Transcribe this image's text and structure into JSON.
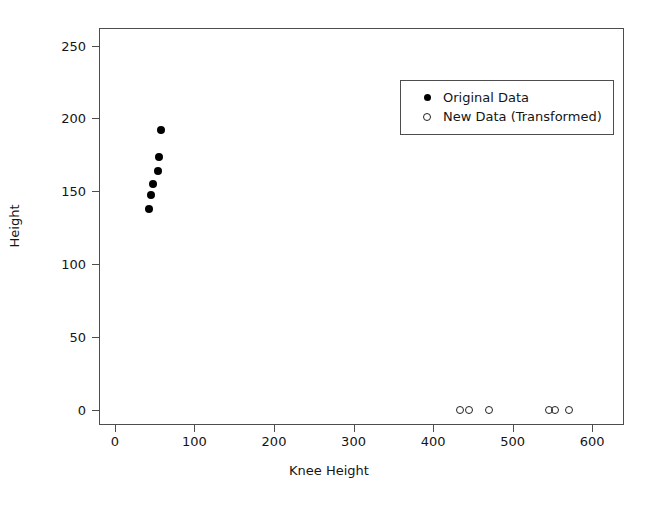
{
  "chart_data": {
    "type": "scatter",
    "title": "",
    "xlabel": "Knee Height",
    "ylabel": "Height",
    "xlim": [
      -20,
      640
    ],
    "ylim": [
      -10,
      262
    ],
    "xticks": [
      0,
      100,
      200,
      300,
      400,
      500,
      600
    ],
    "yticks": [
      0,
      50,
      100,
      150,
      200,
      250
    ],
    "grid": false,
    "legend_position": "top-right",
    "series": [
      {
        "name": "Original Data",
        "marker": "filled-circle",
        "color": "#000000",
        "points": [
          {
            "x": 57,
            "y": 193
          },
          {
            "x": 54,
            "y": 174
          },
          {
            "x": 53,
            "y": 165
          },
          {
            "x": 46,
            "y": 156
          },
          {
            "x": 44,
            "y": 148
          },
          {
            "x": 42,
            "y": 139
          }
        ]
      },
      {
        "name": "New Data (Transformed)",
        "marker": "open-circle",
        "color": "#222222",
        "points": [
          {
            "x": 433,
            "y": 1
          },
          {
            "x": 444,
            "y": 1
          },
          {
            "x": 469,
            "y": 1
          },
          {
            "x": 545,
            "y": 1
          },
          {
            "x": 552,
            "y": 1
          },
          {
            "x": 570,
            "y": 1
          }
        ]
      }
    ]
  },
  "legend": {
    "entries": [
      {
        "label": "Original Data",
        "marker": "filled-circle"
      },
      {
        "label": "New Data (Transformed)",
        "marker": "open-circle"
      }
    ]
  }
}
